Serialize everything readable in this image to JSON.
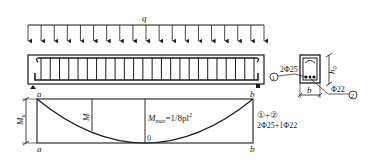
{
  "load": {
    "label": "q",
    "arrow_count": 19
  },
  "beam": {
    "stirrup_count": 24
  },
  "moment_diagram": {
    "support_left_top": "a",
    "support_left_bottom": "a",
    "support_right_top": "b",
    "support_right_bottom": "b",
    "ordinate_label": "M",
    "ultimate_label_main": "M",
    "ultimate_label_sub": "u",
    "max_label_main": "M",
    "max_label_sub": "max",
    "max_formula": "=1/8pl",
    "max_formula_exp": "2",
    "zero_label": "0",
    "reinf_marks": "①+②",
    "reinf_spec": "2Φ25+1Φ22"
  },
  "cross_section": {
    "bar1_mark": "①",
    "bar1_spec": "2Φ25",
    "bar2_mark": "②",
    "bar2_spec": "Φ22",
    "width_label": "b",
    "depth_label_main": "h",
    "depth_label_sub": "0"
  }
}
